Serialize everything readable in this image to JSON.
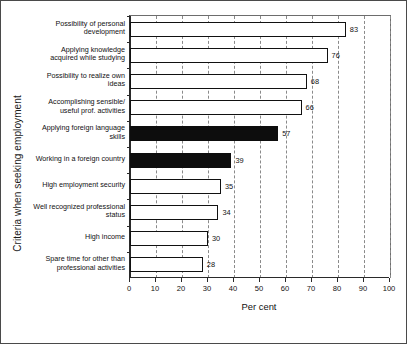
{
  "chart_data": {
    "type": "bar",
    "orientation": "horizontal",
    "title": "",
    "xlabel": "Per cent",
    "ylabel": "Criteria when seeking employment",
    "xlim": [
      0,
      100
    ],
    "xticks": [
      0,
      10,
      20,
      30,
      40,
      50,
      60,
      70,
      80,
      90,
      100
    ],
    "grid": "vertical-dashed",
    "legend": "none",
    "categories": [
      "Possibility of personal development",
      "Applying knowledge acquired while studying",
      "Possibility to realize own ideas",
      "Accomplishing sensible/ useful prof. activities",
      "Applying foreign language skills",
      "Working in a foreign country",
      "High employment security",
      "Well recognized professional status",
      "High income",
      "Spare time for other than professional activities"
    ],
    "values": [
      83,
      76,
      68,
      66,
      57,
      39,
      35,
      34,
      30,
      28
    ],
    "bar_styles": [
      "open",
      "open",
      "open",
      "open",
      "filled",
      "filled",
      "open",
      "open",
      "open",
      "open"
    ],
    "colors": {
      "open_fill": "#ffffff",
      "filled_fill": "#0d0d0d",
      "bar_border": "#111111",
      "grid": "#8a8a8a",
      "axis": "#2a2a2a",
      "background": "#ffffff"
    },
    "category_lines": [
      [
        "Possibility of personal",
        "development"
      ],
      [
        "Applying knowledge",
        "acquired while studying"
      ],
      [
        "Possibility to realize own",
        "ideas"
      ],
      [
        "Accomplishing sensible/",
        "useful prof. activities"
      ],
      [
        "Applying foreign language",
        "skills"
      ],
      [
        "Working in a foreign country"
      ],
      [
        "High employment security"
      ],
      [
        "Well recognized professional",
        "status"
      ],
      [
        "High income"
      ],
      [
        "Spare time for other than",
        "professional activities"
      ]
    ]
  }
}
